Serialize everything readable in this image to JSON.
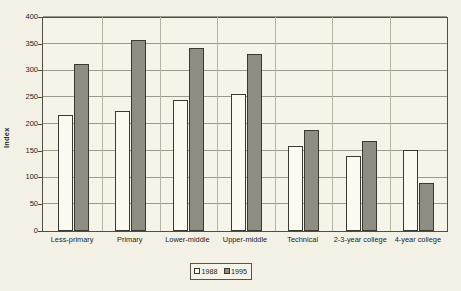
{
  "chart_data": {
    "type": "bar",
    "title": "",
    "xlabel": "",
    "ylabel": "Index",
    "ylim": [
      0,
      400
    ],
    "ytick_step": 50,
    "yticks": [
      0,
      50,
      100,
      150,
      200,
      250,
      300,
      350,
      400
    ],
    "grid": true,
    "legend_position": "bottom-center",
    "categories": [
      "Less-primary",
      "Primary",
      "Lower-middle",
      "Upper-middle",
      "Technical",
      "2-3-year college",
      "4-year college"
    ],
    "series": [
      {
        "name": "1988",
        "color": "#fbfaf1",
        "values": [
          218,
          224,
          246,
          256,
          159,
          140,
          151
        ]
      },
      {
        "name": "1995",
        "color": "#8d8d82",
        "values": [
          313,
          358,
          343,
          331,
          190,
          168,
          89
        ]
      }
    ]
  },
  "legend": {
    "items": [
      {
        "label": "1988"
      },
      {
        "label": "1995"
      }
    ]
  },
  "colors": {
    "background": "#f3f1e5",
    "plot_background": "#f6f4e9",
    "axis": "#4e4e45",
    "gridline": "#9b9b8d",
    "bar_1988": "#fbfaf1",
    "bar_1995": "#8d8d82",
    "text": "#23231e"
  }
}
